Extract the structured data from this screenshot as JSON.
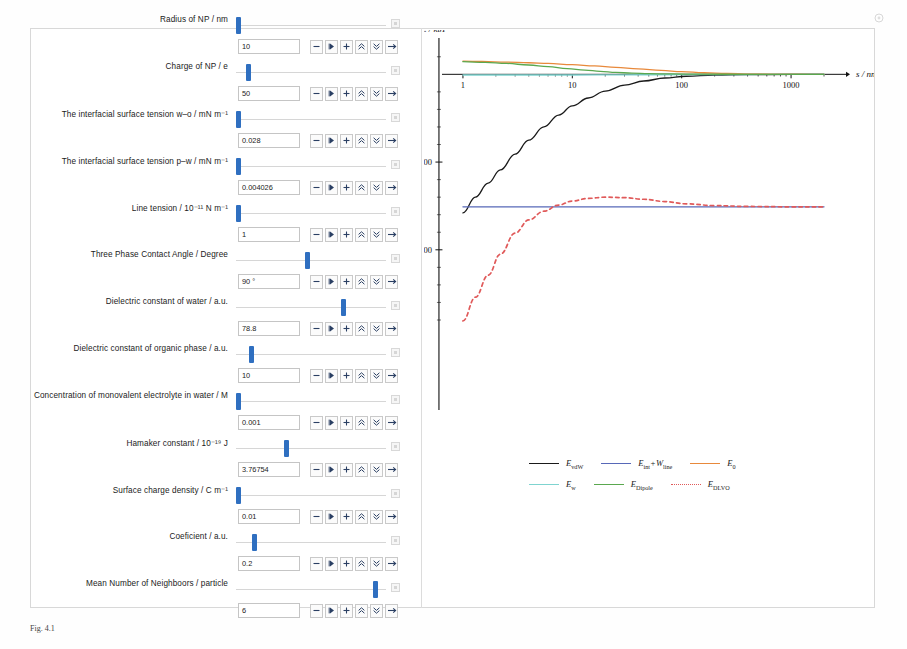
{
  "window": {
    "corner_icon": "target-icon"
  },
  "controls": {
    "buttons": [
      {
        "name": "decrement-button",
        "glyph": "minus"
      },
      {
        "name": "play-button",
        "glyph": "play"
      },
      {
        "name": "increment-button",
        "glyph": "plus"
      },
      {
        "name": "step-up-button",
        "glyph": "chevrons-up"
      },
      {
        "name": "step-down-button",
        "glyph": "chevrons-down"
      },
      {
        "name": "reset-button",
        "glyph": "arrow-right"
      }
    ],
    "parameters": [
      {
        "label": "Radius of NP / nm",
        "value": "10",
        "thumb_pct": 0
      },
      {
        "label": "Charge of NP / e",
        "value": "50",
        "thumb_pct": 7
      },
      {
        "label": "The interfacial surface tension w–o  / mN m⁻¹",
        "value": "0.028",
        "thumb_pct": 0
      },
      {
        "label": "The interfacial surface tension p–w / mN m⁻¹",
        "value": "0.004026",
        "thumb_pct": 0
      },
      {
        "label": "Line tension / 10⁻¹¹ N m⁻¹",
        "value": "1",
        "thumb_pct": 0
      },
      {
        "label": "Three Phase Contact Angle / Degree",
        "value": "90 °",
        "thumb_pct": 47
      },
      {
        "label": "Dielectric constant of water / a.u.",
        "value": "78.8",
        "thumb_pct": 72
      },
      {
        "label": "Dielectric constant of organic phase / a.u.",
        "value": "10",
        "thumb_pct": 9
      },
      {
        "label": "Concentration of monovalent electrolyte in water / M",
        "value": "0.001",
        "thumb_pct": 0
      },
      {
        "label": "Hamaker constant / 10⁻¹⁹ J",
        "value": "3.76754",
        "thumb_pct": 33
      },
      {
        "label": "Surface charge density / C m⁻¹",
        "value": "0.01",
        "thumb_pct": 0
      },
      {
        "label": "Coeficient / a.u.",
        "value": "0.2",
        "thumb_pct": 11
      },
      {
        "label": "Mean Number of Neighboors / particle",
        "value": "6",
        "thumb_pct": 94
      }
    ]
  },
  "chart_data": {
    "type": "line",
    "title": "",
    "xlabel": "s / nm",
    "ylabel": "E / kʙT",
    "xscale": "log",
    "xlim": [
      0.7,
      2000
    ],
    "ylim": [
      -1400,
      150
    ],
    "xticks": [
      "1",
      "10",
      "100",
      "1000"
    ],
    "xtick_values": [
      1,
      10,
      100,
      1000
    ],
    "yticks": [
      "- 500",
      "- 1000"
    ],
    "ytick_values": [
      -500,
      -1000
    ],
    "grid": false,
    "legend_position": "bottom",
    "series": [
      {
        "name": "E_vdW",
        "label": "E",
        "label_sub": "vdW",
        "color": "#1a1a1a",
        "style": "solid",
        "x": [
          1,
          1.3,
          1.7,
          2.2,
          3,
          4,
          5.5,
          7.5,
          10,
          14,
          20,
          30,
          45,
          70,
          110,
          200,
          400,
          1000,
          2000
        ],
        "y": [
          -790,
          -700,
          -620,
          -545,
          -455,
          -375,
          -300,
          -232,
          -180,
          -135,
          -96,
          -62,
          -38,
          -21,
          -11,
          -5,
          -2,
          -0.6,
          -0.2
        ]
      },
      {
        "name": "E_int+W_line",
        "label": "E",
        "label_sub": "int",
        "label_extra": "+W",
        "label_extra_sub": "line",
        "color": "#5768b8",
        "style": "solid",
        "x": [
          1,
          10,
          100,
          1000,
          2000
        ],
        "y": [
          -755,
          -755,
          -755,
          -755,
          -755
        ]
      },
      {
        "name": "E_0",
        "label": "E",
        "label_sub": "0",
        "color": "#e8893b",
        "style": "solid",
        "x": [
          1,
          1.5,
          2.5,
          4,
          6,
          10,
          16,
          25,
          40,
          65,
          100,
          160,
          260,
          420,
          700,
          1200,
          2000
        ],
        "y": [
          75,
          73,
          70,
          66,
          62,
          55,
          48,
          40,
          31,
          22,
          15,
          9,
          5,
          2.4,
          1.1,
          0.4,
          0.1
        ]
      },
      {
        "name": "E_w",
        "label": "E",
        "label_sub": "w",
        "color": "#7fd4d0",
        "style": "solid",
        "x": [
          1,
          3,
          10,
          30,
          100,
          400,
          1000,
          2000
        ],
        "y": [
          -4,
          -4,
          -4,
          -3,
          -2,
          -1,
          -0.4,
          -0.2
        ]
      },
      {
        "name": "E_Dipole",
        "label": "E",
        "label_sub": "Dipole",
        "color": "#5aa84f",
        "style": "solid",
        "x": [
          1,
          1.6,
          2.5,
          4,
          6,
          9,
          13,
          18,
          25,
          35,
          50,
          80,
          150,
          400,
          1000,
          2000
        ],
        "y": [
          72,
          68,
          62,
          53,
          44,
          33,
          24,
          17,
          11,
          7,
          4,
          2,
          0.8,
          0.2,
          0.05,
          0.02
        ]
      },
      {
        "name": "E_DLVO",
        "label": "E",
        "label_sub": "DLVO",
        "color": "#e05a5a",
        "style": "dotted",
        "x": [
          1,
          1.3,
          1.7,
          2.2,
          3,
          4,
          5.5,
          7.5,
          10,
          14,
          20,
          30,
          45,
          70,
          110,
          200,
          400,
          1000,
          2000
        ],
        "y": [
          -1405,
          -1270,
          -1145,
          -1025,
          -905,
          -830,
          -780,
          -745,
          -722,
          -707,
          -700,
          -703,
          -712,
          -725,
          -738,
          -748,
          -753,
          -755,
          -755
        ]
      }
    ]
  },
  "caption": {
    "text": "Fig. 4.1"
  }
}
